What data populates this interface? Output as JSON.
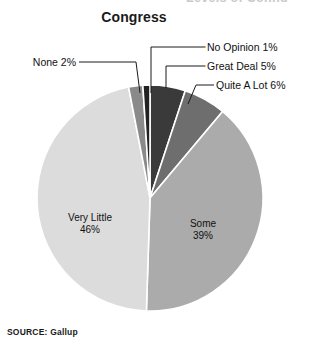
{
  "page": {
    "cut_off_header": "Levels of Confid",
    "source_note": "SOURCE: Gallup"
  },
  "chart_data": {
    "type": "pie",
    "title": "Congress",
    "subtitle": "",
    "xlabel": "",
    "ylabel": "",
    "legend_position": "none",
    "grid": false,
    "total_percent": 99,
    "categories": [
      "Great Deal",
      "Quite A Lot",
      "Some",
      "Very Little",
      "None",
      "No Opinion"
    ],
    "values": [
      5,
      6,
      39,
      46,
      2,
      1
    ],
    "labels": [
      "Great Deal 5%",
      "Quite A Lot 6%",
      "Some 39%",
      "Very Little 46%",
      "None 2%",
      "No Opinion 1%"
    ],
    "colors": [
      "#3a3a3a",
      "#6e6e6e",
      "#ababab",
      "#dcdcdc",
      "#8a8a8a",
      "#222222"
    ],
    "slice_border_color": "#ffffff",
    "start_angle_deg": 0,
    "direction": "clockwise",
    "slices": [
      {
        "name": "Great Deal",
        "percent": 5,
        "label": "Great Deal 5%",
        "color": "#3a3a3a",
        "label_placement": "callout-right"
      },
      {
        "name": "Quite A Lot",
        "percent": 6,
        "label": "Quite A Lot 6%",
        "color": "#6e6e6e",
        "label_placement": "callout-right"
      },
      {
        "name": "Some",
        "percent": 39,
        "label": "Some 39%",
        "color": "#ababab",
        "label_placement": "inside"
      },
      {
        "name": "Very Little",
        "percent": 46,
        "label": "Very Little 46%",
        "color": "#dcdcdc",
        "label_placement": "inside"
      },
      {
        "name": "None",
        "percent": 2,
        "label": "None 2%",
        "color": "#8a8a8a",
        "label_placement": "callout-left"
      },
      {
        "name": "No Opinion",
        "percent": 1,
        "label": "No Opinion 1%",
        "color": "#222222",
        "label_placement": "callout-right"
      }
    ]
  },
  "callouts": {
    "no_opinion": "No Opinion 1%",
    "great_deal": "Great Deal 5%",
    "quite_a_lot": "Quite A Lot 6%",
    "none": "None 2%"
  },
  "inside_labels": {
    "very_little_name": "Very Little",
    "very_little_pct": "46%",
    "some_name": "Some",
    "some_pct": "39%"
  }
}
